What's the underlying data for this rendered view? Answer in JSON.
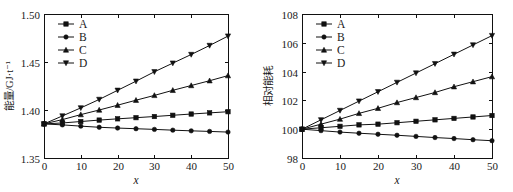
{
  "figure": {
    "background": "#ffffff",
    "line_color": "#111111",
    "panels": [
      "left",
      "right"
    ]
  },
  "chart_data": [
    {
      "type": "line",
      "panel": "left",
      "title": "",
      "xlabel": "x",
      "ylabel": "能量/GJ·t⁻¹",
      "xlim": [
        0,
        50
      ],
      "ylim": [
        1.35,
        1.5
      ],
      "xticks": [
        0,
        10,
        20,
        30,
        40,
        50
      ],
      "xticklabels": [
        "0",
        "10",
        "20",
        "30",
        "40",
        "50"
      ],
      "yticks": [
        1.35,
        1.4,
        1.45,
        1.5
      ],
      "yticklabels": [
        "1.35",
        "1.40",
        "1.45",
        "1.50"
      ],
      "grid": false,
      "legend_position": "upper-left",
      "x": [
        0,
        5,
        10,
        15,
        20,
        25,
        30,
        35,
        40,
        45,
        50
      ],
      "series": [
        {
          "name": "A",
          "marker": "square",
          "values": [
            1.3855,
            1.3865,
            1.388,
            1.3895,
            1.3908,
            1.392,
            1.3932,
            1.3945,
            1.3958,
            1.397,
            1.3982
          ]
        },
        {
          "name": "B",
          "marker": "circle",
          "values": [
            1.3855,
            1.3845,
            1.3832,
            1.382,
            1.3812,
            1.3805,
            1.3798,
            1.379,
            1.3783,
            1.3777,
            1.377
          ]
        },
        {
          "name": "C",
          "marker": "triangle-up",
          "values": [
            1.3855,
            1.39,
            1.3952,
            1.4,
            1.405,
            1.4102,
            1.4152,
            1.4205,
            1.4255,
            1.4305,
            1.4358
          ]
        },
        {
          "name": "D",
          "marker": "triangle-down",
          "values": [
            1.3855,
            1.3938,
            1.4022,
            1.411,
            1.4205,
            1.43,
            1.4398,
            1.4488,
            1.4578,
            1.4672,
            1.477
          ]
        }
      ]
    },
    {
      "type": "line",
      "panel": "right",
      "title": "",
      "xlabel": "x",
      "ylabel": "相对能耗",
      "xlim": [
        0,
        50
      ],
      "ylim": [
        98,
        108
      ],
      "xticks": [
        0,
        10,
        20,
        30,
        40,
        50
      ],
      "xticklabels": [
        "0",
        "10",
        "20",
        "30",
        "40",
        "50"
      ],
      "yticks": [
        98,
        100,
        102,
        104,
        106,
        108
      ],
      "yticklabels": [
        "98",
        "100",
        "102",
        "104",
        "106",
        "108"
      ],
      "grid": false,
      "legend_position": "upper-left",
      "x": [
        0,
        5,
        10,
        15,
        20,
        25,
        30,
        35,
        40,
        45,
        50
      ],
      "series": [
        {
          "name": "A",
          "marker": "square",
          "values": [
            100.0,
            100.1,
            100.2,
            100.3,
            100.35,
            100.45,
            100.55,
            100.65,
            100.75,
            100.85,
            100.95
          ]
        },
        {
          "name": "B",
          "marker": "circle",
          "values": [
            100.0,
            99.9,
            99.8,
            99.72,
            99.65,
            99.58,
            99.5,
            99.42,
            99.35,
            99.27,
            99.2
          ]
        },
        {
          "name": "C",
          "marker": "triangle-up",
          "values": [
            100.0,
            100.35,
            100.7,
            101.1,
            101.45,
            101.85,
            102.2,
            102.55,
            102.95,
            103.3,
            103.65
          ]
        },
        {
          "name": "D",
          "marker": "triangle-down",
          "values": [
            100.0,
            100.65,
            101.3,
            101.95,
            102.6,
            103.25,
            103.9,
            104.55,
            105.2,
            105.85,
            106.5
          ]
        }
      ]
    }
  ]
}
